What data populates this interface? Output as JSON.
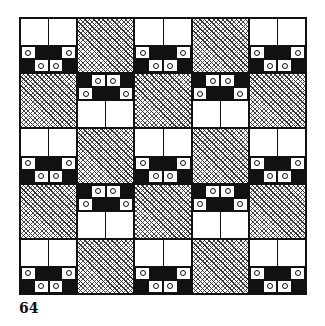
{
  "figure": {
    "label": "64",
    "grid": {
      "rows": 5,
      "cols": 5,
      "layout": [
        [
          "white-upright",
          "hatched",
          "white-upright",
          "hatched",
          "white-upright"
        ],
        [
          "hatched",
          "white-inverted",
          "hatched",
          "white-inverted",
          "hatched"
        ],
        [
          "white-upright",
          "hatched",
          "white-upright",
          "hatched",
          "white-upright"
        ],
        [
          "hatched",
          "white-inverted",
          "hatched",
          "white-inverted",
          "hatched"
        ],
        [
          "white-upright",
          "hatched",
          "white-upright",
          "hatched",
          "white-upright"
        ]
      ],
      "hatch_style": "cross-hatch diagonal",
      "colors": {
        "ink": "#111111",
        "paper": "#ffffff"
      }
    },
    "white_tile_motif": {
      "top_area": "two white squares",
      "strip_1": [
        "dot",
        "black-wide",
        "dot"
      ],
      "strip_2": [
        "black",
        "dot",
        "dot",
        "black"
      ]
    }
  }
}
